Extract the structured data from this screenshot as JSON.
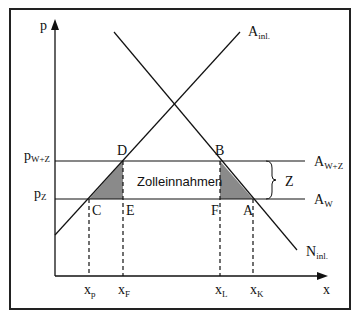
{
  "diagram": {
    "title": "",
    "axes": {
      "y_label": "p",
      "x_label": "x"
    },
    "curves": {
      "supply": {
        "label": "A",
        "label_sub": "inl."
      },
      "demand": {
        "label": "N",
        "label_sub": "inl."
      },
      "world_plus_tariff": {
        "label": "A",
        "label_sub": "W+Z"
      },
      "world": {
        "label": "A",
        "label_sub": "W"
      }
    },
    "price_labels": {
      "p_wz": {
        "label": "p",
        "label_sub": "W+Z"
      },
      "p_z": {
        "label": "p",
        "label_sub": "Z"
      }
    },
    "points": {
      "D": "D",
      "B": "B",
      "C": "C",
      "E": "E",
      "F": "F",
      "A": "A"
    },
    "quantity_labels": {
      "xp": {
        "label": "x",
        "label_sub": "p"
      },
      "xF": {
        "label": "x",
        "label_sub": "F"
      },
      "xL": {
        "label": "x",
        "label_sub": "L"
      },
      "xK": {
        "label": "x",
        "label_sub": "K"
      }
    },
    "region_label": "Zolleinnahmen",
    "tariff_label": "Z",
    "colors": {
      "line": "#111111",
      "shaded": "#8a8a8a",
      "frame": "#222222"
    }
  }
}
